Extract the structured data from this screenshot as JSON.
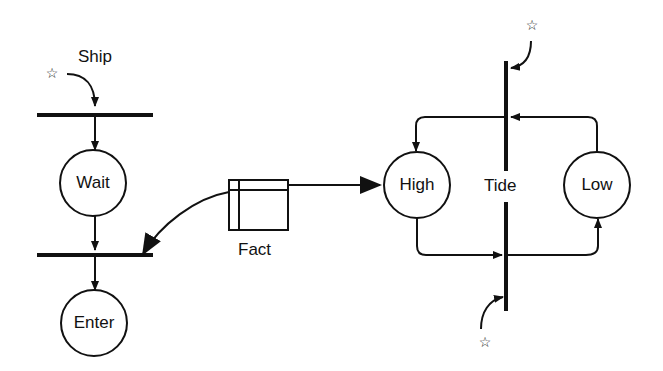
{
  "diagram": {
    "type": "petri-net",
    "labels": {
      "ship": "Ship",
      "fact": "Fact",
      "tide": "Tide"
    },
    "places": [
      {
        "id": "wait",
        "label": "Wait"
      },
      {
        "id": "enter",
        "label": "Enter"
      },
      {
        "id": "high",
        "label": "High"
      },
      {
        "id": "low",
        "label": "Low"
      }
    ],
    "external_markers": {
      "star": "☆"
    },
    "colors": {
      "ink": "#111111",
      "background": "#ffffff"
    }
  }
}
